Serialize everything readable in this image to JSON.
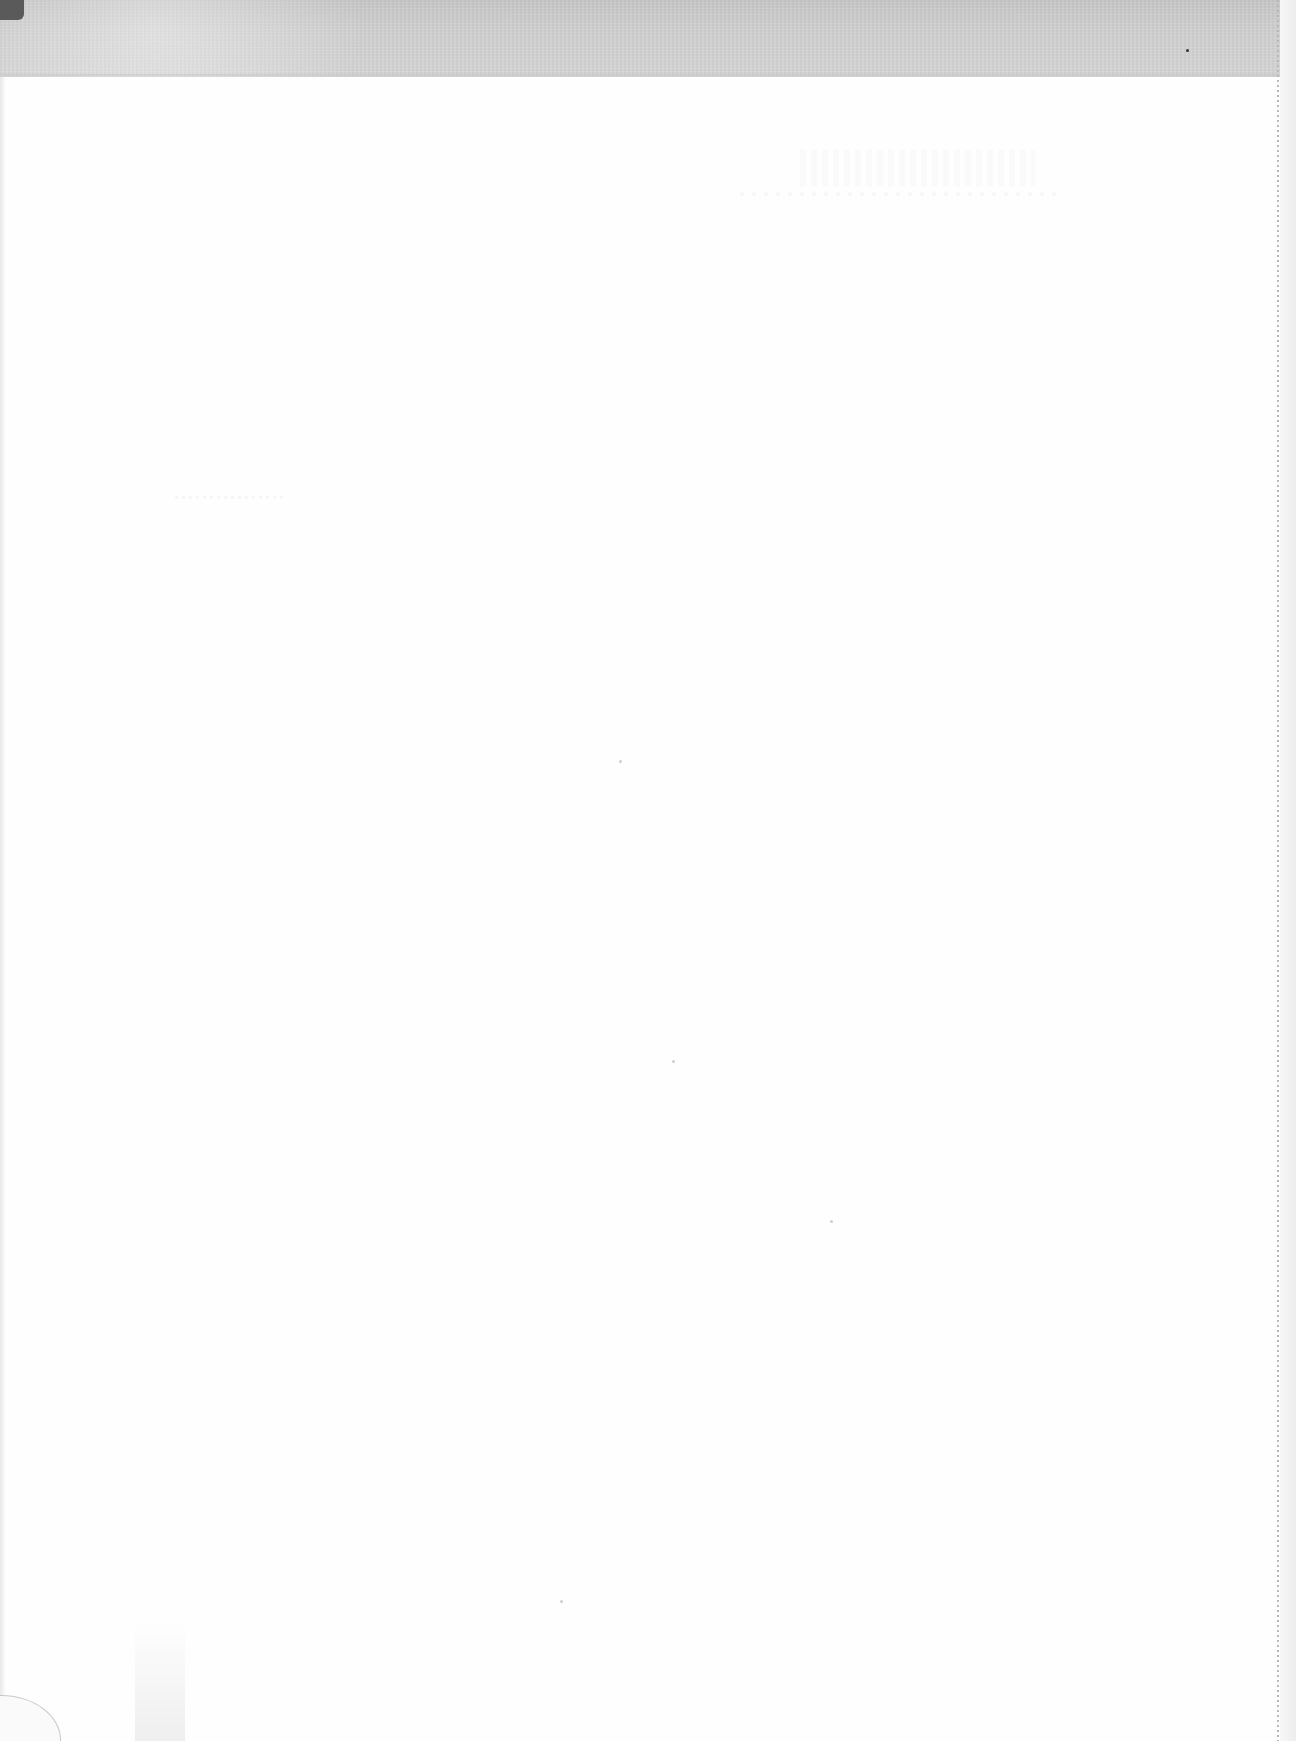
{
  "document": {
    "type": "scanned-page",
    "content_state": "blank",
    "legible_text": [],
    "colors": {
      "paper": "#fefefe",
      "scan_band": "#d2d2d2",
      "perforation": "#b8b8b8",
      "corner_shadow": "#5a5a5a"
    }
  }
}
